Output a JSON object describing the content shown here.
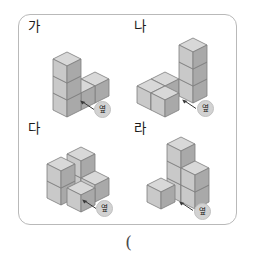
{
  "page": {
    "answer_paren": "(",
    "colors": {
      "panel_border": "#b9b9b9",
      "cube_top": "#d8d8d8",
      "cube_left": "#c9c9c9",
      "cube_right": "#a9a9a9",
      "cube_edge": "#7d7d7d",
      "marker_bubble": "#d2d2d2",
      "text": "#1b1b1b"
    }
  },
  "items": [
    {
      "id": "ga",
      "label": "가",
      "marker": {
        "text": "옆",
        "icon": "arrow-up-left-icon"
      },
      "figure": {
        "type": "isometric-cube-stack",
        "description": "bottom row of three cubes extending right, with two additional cubes stacked on the leftmost column",
        "cube_count": 5,
        "cubes": [
          {
            "x": 0,
            "y": 0,
            "z": 0
          },
          {
            "x": 1,
            "y": 0,
            "z": 0
          },
          {
            "x": 2,
            "y": 0,
            "z": 0
          },
          {
            "x": 0,
            "y": 0,
            "z": 1
          },
          {
            "x": 0,
            "y": 0,
            "z": 2
          }
        ]
      }
    },
    {
      "id": "na",
      "label": "나",
      "marker": {
        "text": "옆",
        "icon": "arrow-up-left-icon"
      },
      "figure": {
        "type": "isometric-cube-stack",
        "description": "tall column of three cubes at right with an L of cubes extending left at the base",
        "cube_count": 6,
        "cubes": [
          {
            "x": 2,
            "y": 0,
            "z": 0
          },
          {
            "x": 2,
            "y": 0,
            "z": 1
          },
          {
            "x": 2,
            "y": 0,
            "z": 2
          },
          {
            "x": 0,
            "y": 0,
            "z": 0
          },
          {
            "x": 1,
            "y": 0,
            "z": 0
          },
          {
            "x": 1,
            "y": 1,
            "z": 0
          }
        ]
      }
    },
    {
      "id": "da",
      "label": "다",
      "marker": {
        "text": "옆",
        "icon": "arrow-up-left-icon"
      },
      "figure": {
        "type": "isometric-cube-stack",
        "description": "two-high column on the left, a tall back column, and two cubes extending to the right front",
        "cube_count": 6,
        "cubes": [
          {
            "x": 0,
            "y": 0,
            "z": 0
          },
          {
            "x": 0,
            "y": 0,
            "z": 1
          },
          {
            "x": 1,
            "y": 0,
            "z": 0
          },
          {
            "x": 1,
            "y": 0,
            "z": 1
          },
          {
            "x": 2,
            "y": 0,
            "z": 0
          },
          {
            "x": 1,
            "y": 1,
            "z": 0
          }
        ]
      }
    },
    {
      "id": "ra",
      "label": "라",
      "marker": {
        "text": "옆",
        "icon": "arrow-up-left-icon"
      },
      "figure": {
        "type": "isometric-cube-stack",
        "description": "pyramid-like arrangement with a peak cube on top of a middle column flanked by lower cubes",
        "cube_count": 6,
        "cubes": [
          {
            "x": 1,
            "y": 0,
            "z": 0
          },
          {
            "x": 1,
            "y": 0,
            "z": 1
          },
          {
            "x": 1,
            "y": 0,
            "z": 2
          },
          {
            "x": 0,
            "y": 0,
            "z": 0
          },
          {
            "x": 2,
            "y": 0,
            "z": 0
          },
          {
            "x": 2,
            "y": 0,
            "z": 1
          }
        ]
      }
    }
  ]
}
